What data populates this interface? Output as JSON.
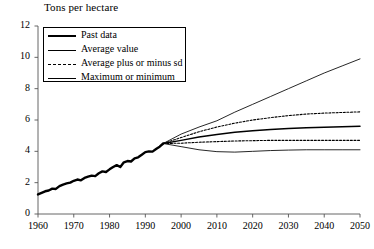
{
  "chart_data": {
    "type": "line",
    "title": "Tons per hectare",
    "xlabel": "",
    "ylabel": "Tons per hectare",
    "xlim": [
      1960,
      2050
    ],
    "ylim": [
      0,
      12
    ],
    "grid": false,
    "legend_position": "upper-left",
    "xticks": [
      "1960",
      "1970",
      "1980",
      "1990",
      "2000",
      "2010",
      "2020",
      "2030",
      "2040",
      "2050"
    ],
    "yticks": [
      "0",
      "2",
      "4",
      "6",
      "8",
      "10",
      "12"
    ],
    "legend": [
      {
        "label": "Past data",
        "style": "thick-solid"
      },
      {
        "label": "Average value",
        "style": "medium-solid"
      },
      {
        "label": "Average plus or minus sd",
        "style": "dashed"
      },
      {
        "label": "Maximum or minimum",
        "style": "thin-solid"
      }
    ],
    "series": [
      {
        "name": "Past data",
        "style": "thick-solid",
        "x": [
          1960,
          1961,
          1962,
          1963,
          1964,
          1965,
          1966,
          1967,
          1968,
          1969,
          1970,
          1971,
          1972,
          1973,
          1974,
          1975,
          1976,
          1977,
          1978,
          1979,
          1980,
          1981,
          1982,
          1983,
          1984,
          1985,
          1986,
          1987,
          1988,
          1989,
          1990,
          1991,
          1992,
          1993,
          1994,
          1995
        ],
        "values": [
          1.25,
          1.35,
          1.45,
          1.5,
          1.62,
          1.6,
          1.78,
          1.88,
          1.95,
          2.0,
          2.12,
          2.2,
          2.15,
          2.3,
          2.38,
          2.45,
          2.42,
          2.6,
          2.72,
          2.68,
          2.85,
          3.0,
          3.12,
          3.0,
          3.3,
          3.38,
          3.35,
          3.55,
          3.62,
          3.78,
          3.95,
          4.0,
          3.98,
          4.15,
          4.3,
          4.5
        ]
      },
      {
        "name": "Average value",
        "style": "medium-solid",
        "x": [
          1995,
          2000,
          2005,
          2010,
          2015,
          2020,
          2025,
          2030,
          2035,
          2040,
          2045,
          2050
        ],
        "values": [
          4.5,
          4.7,
          4.92,
          5.08,
          5.22,
          5.32,
          5.4,
          5.46,
          5.5,
          5.54,
          5.57,
          5.6
        ]
      },
      {
        "name": "Average plus sd",
        "style": "dashed",
        "x": [
          1995,
          2000,
          2005,
          2010,
          2015,
          2020,
          2025,
          2030,
          2035,
          2040,
          2045,
          2050
        ],
        "values": [
          4.5,
          4.88,
          5.25,
          5.55,
          5.8,
          6.0,
          6.15,
          6.28,
          6.38,
          6.44,
          6.48,
          6.52
        ]
      },
      {
        "name": "Average minus sd",
        "style": "dashed",
        "x": [
          1995,
          2000,
          2005,
          2010,
          2015,
          2020,
          2025,
          2030,
          2035,
          2040,
          2045,
          2050
        ],
        "values": [
          4.5,
          4.52,
          4.58,
          4.62,
          4.66,
          4.68,
          4.7,
          4.7,
          4.7,
          4.7,
          4.7,
          4.7
        ]
      },
      {
        "name": "Maximum",
        "style": "thin-solid",
        "x": [
          1995,
          2000,
          2005,
          2010,
          2015,
          2020,
          2025,
          2030,
          2035,
          2040,
          2045,
          2050
        ],
        "values": [
          4.5,
          5.1,
          5.55,
          5.95,
          6.5,
          7.0,
          7.5,
          8.0,
          8.5,
          9.0,
          9.45,
          9.9
        ]
      },
      {
        "name": "Minimum",
        "style": "thin-solid",
        "x": [
          1995,
          2000,
          2005,
          2010,
          2015,
          2020,
          2025,
          2030,
          2035,
          2040,
          2045,
          2050
        ],
        "values": [
          4.5,
          4.3,
          4.1,
          3.98,
          3.95,
          4.0,
          4.05,
          4.08,
          4.1,
          4.1,
          4.1,
          4.1
        ]
      }
    ]
  }
}
